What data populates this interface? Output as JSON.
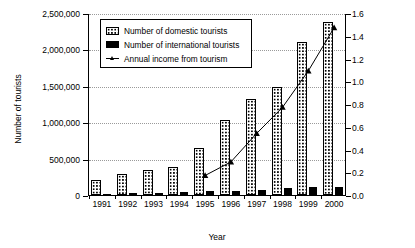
{
  "chart_data": {
    "type": "bar",
    "title": "",
    "xlabel": "Year",
    "ylabel": "Number of tourists",
    "ylabel_secondary": "Annual income from tourism (billion CNY*)",
    "categories": [
      "1991",
      "1992",
      "1993",
      "1994",
      "1995",
      "1996",
      "1997",
      "1998",
      "1999",
      "2000"
    ],
    "ylim": [
      0,
      2500000
    ],
    "ylim_secondary": [
      0.0,
      1.6
    ],
    "yticks": [
      "0",
      "500,000",
      "1,000,000",
      "1,500,000",
      "2,000,000",
      "2,500,000"
    ],
    "ytick_values": [
      0,
      500000,
      1000000,
      1500000,
      2000000,
      2500000
    ],
    "yticks_secondary": [
      "0.0",
      "0.2",
      "0.4",
      "0.6",
      "0.8",
      "1.0",
      "1.2",
      "1.4",
      "1.6"
    ],
    "ytick_values_secondary": [
      0.0,
      0.2,
      0.4,
      0.6,
      0.8,
      1.0,
      1.2,
      1.4,
      1.6
    ],
    "grid": true,
    "legend_position": "upper left",
    "series": [
      {
        "name": "Number of domestic tourists",
        "type": "bar",
        "axis": "left",
        "values": [
          200000,
          290000,
          340000,
          390000,
          650000,
          1030000,
          1320000,
          1490000,
          2100000,
          2380000
        ]
      },
      {
        "name": "Number of international tourists",
        "type": "bar",
        "axis": "left",
        "values": [
          20000,
          25000,
          30000,
          35000,
          55000,
          60000,
          70000,
          95000,
          105000,
          115000
        ]
      },
      {
        "name": "Annual income from tourism",
        "type": "line",
        "axis": "right",
        "marker": "triangle",
        "x": [
          "1995",
          "1996",
          "1997",
          "1998",
          "1999",
          "2000"
        ],
        "values": [
          0.18,
          0.3,
          0.55,
          0.78,
          1.1,
          1.48
        ]
      }
    ]
  },
  "legend": {
    "items": [
      {
        "label": "Number of domestic tourists",
        "marker": "dotted-bar-swatch"
      },
      {
        "label": "Number of international tourists",
        "marker": "solid-black-swatch"
      },
      {
        "label": "Annual income from tourism",
        "marker": "line-triangle-swatch"
      }
    ]
  }
}
